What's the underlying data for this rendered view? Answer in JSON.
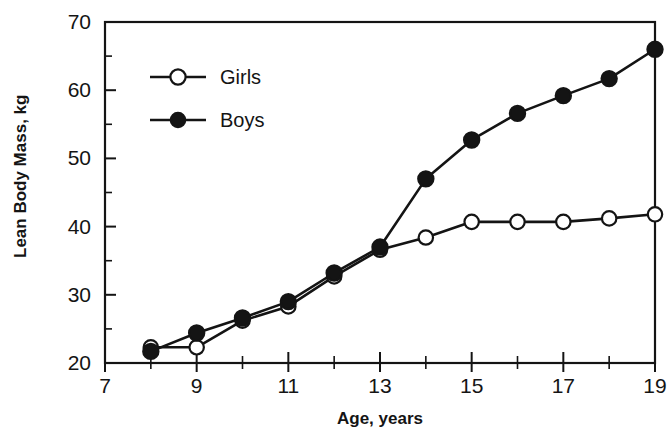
{
  "chart_data": {
    "type": "line",
    "title": "",
    "xlabel": "Age, years",
    "ylabel": "Lean Body Mass, kg",
    "xlim": [
      7,
      19
    ],
    "ylim": [
      20,
      70
    ],
    "xticks": [
      7,
      9,
      11,
      13,
      15,
      17,
      19
    ],
    "xtick_labels": [
      "7",
      "9",
      "11",
      "13",
      "15",
      "17",
      "19"
    ],
    "xticks_minor": [
      8,
      10,
      12,
      14,
      16,
      18
    ],
    "yticks": [
      20,
      30,
      40,
      50,
      60,
      70
    ],
    "ytick_labels": [
      "20",
      "30",
      "40",
      "50",
      "60",
      "70"
    ],
    "yticks_minor": [
      25,
      35,
      45,
      55,
      65
    ],
    "grid": false,
    "legend_position": "upper-left-inside",
    "x": [
      8,
      9,
      10,
      11,
      12,
      13,
      14,
      15,
      16,
      17,
      18,
      19
    ],
    "series": [
      {
        "name": "Girls",
        "marker": "open-circle",
        "color": "#141414",
        "x": [
          8,
          9,
          10,
          11,
          12,
          13,
          14,
          15,
          16,
          17,
          18,
          19
        ],
        "values": [
          22.3,
          22.3,
          26.2,
          28.3,
          32.7,
          36.6,
          38.4,
          40.7,
          40.7,
          40.7,
          41.2,
          41.8
        ]
      },
      {
        "name": "Boys",
        "marker": "filled-circle",
        "color": "#141414",
        "x": [
          8,
          9,
          10,
          11,
          12,
          13,
          14,
          15,
          16,
          17,
          18,
          19
        ],
        "values": [
          21.7,
          24.4,
          26.6,
          29.0,
          33.2,
          37.0,
          47.0,
          52.7,
          56.6,
          59.2,
          61.7,
          66.0
        ]
      }
    ]
  },
  "legend": {
    "items": [
      {
        "label": "Girls",
        "marker": "open-circle"
      },
      {
        "label": "Boys",
        "marker": "filled-circle"
      }
    ]
  },
  "axes": {
    "x_title": "Age, years",
    "y_title": "Lean Body Mass, kg"
  }
}
